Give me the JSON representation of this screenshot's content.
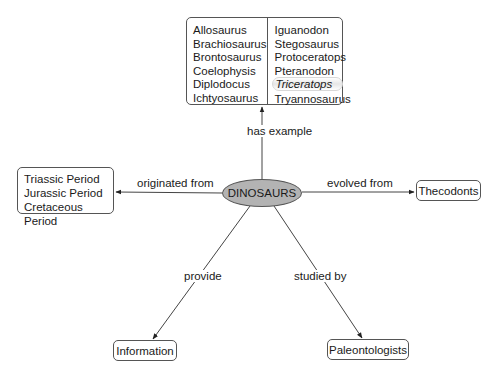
{
  "central_concept": {
    "label": "DINOSAURS",
    "fill": "#b3b3b3"
  },
  "examples_node": {
    "left_column": [
      "Allosaurus",
      "Brachiosaurus",
      "Brontosaurus",
      "Coelophysis",
      "Diplodocus",
      "Ichtyosaurus"
    ],
    "right_column": [
      "Iguanodon",
      "Stegosaurus",
      "Protoceratops",
      "Pteranodon",
      "Triceratops",
      "Tryannosaurus"
    ],
    "highlighted": "Triceratops"
  },
  "periods_node": {
    "items": [
      "Triassic Period",
      "Jurassic Period",
      "Cretaceous Period"
    ]
  },
  "thecodonts_node": {
    "label": "Thecodonts"
  },
  "information_node": {
    "label": "Information"
  },
  "paleontologists_node": {
    "label": "Paleontologists"
  },
  "links": {
    "has_example": "has example",
    "originated_from": "originated from",
    "evolved_from": "evolved from",
    "provide": "provide",
    "studied_by": "studied by"
  }
}
